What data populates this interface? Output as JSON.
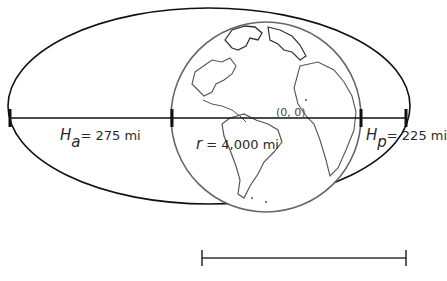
{
  "diagram": {
    "type": "orbit-geometry",
    "colors": {
      "orbit": "#111111",
      "earth_outline": "#555555",
      "coastline": "#444444",
      "axis": "#111111"
    },
    "earth": {
      "label_var": "r",
      "label_value": "= 4,000 mi"
    },
    "apogee": {
      "label_var": "H",
      "label_sub": "a",
      "label_value": "= 275 mi"
    },
    "perigee": {
      "label_var": "H",
      "label_sub": "p",
      "label_value": "= 225 mi"
    },
    "origin": {
      "label": "(0, 0)"
    },
    "scale_bar": {
      "caption_partial": ""
    }
  }
}
